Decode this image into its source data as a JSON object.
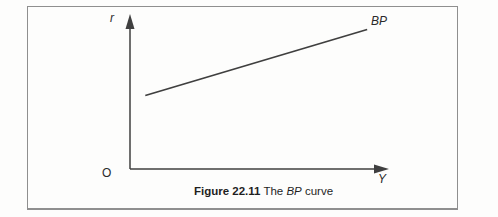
{
  "figure": {
    "axes": {
      "y_axis_label": "r",
      "x_axis_label": "Y",
      "origin_label": "O"
    },
    "curve_label": "BP",
    "caption": {
      "number": "Figure 22.11",
      "text_pre": "The",
      "text_emph": "BP",
      "text_post": "curve"
    }
  },
  "colors": {
    "line": "#3f3f3f",
    "border": "#8f8f8f",
    "background": "#fdfdfc",
    "text": "#1f1f1f"
  },
  "chart_data": {
    "type": "line",
    "title": "Figure 22.11 The BP curve",
    "xlabel": "Y",
    "ylabel": "r",
    "origin_label": "O",
    "axis_numeric": false,
    "grid": false,
    "legend_position": "none",
    "series": [
      {
        "name": "BP",
        "shape": "straight upward-sloping line",
        "points_fraction": [
          {
            "x": 0.06,
            "y": 0.49
          },
          {
            "x": 0.93,
            "y": 0.93
          }
        ]
      }
    ]
  }
}
